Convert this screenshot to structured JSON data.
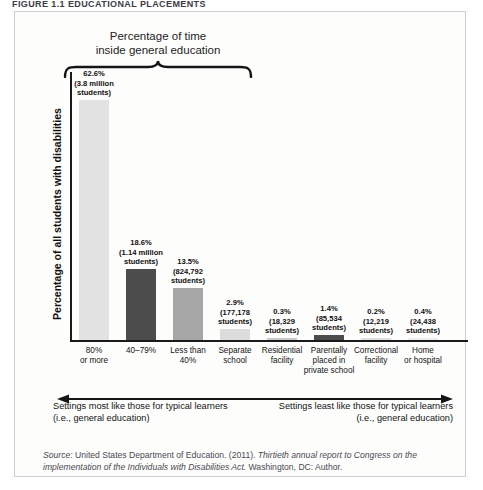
{
  "figure": {
    "heading": "FIGURE 1.1  EDUCATIONAL PLACEMENTS",
    "brace_caption_line1": "Percentage of time",
    "brace_caption_line2": "inside general education",
    "y_axis_title": "Percentage of all students with disabilities",
    "source_prefix": "Source: ",
    "source_text_1": "United States Department of Education. (2011). ",
    "source_italic_1": "Thirtieth annual report to Congress on the implementation of the Individuals with Disabilities Act.",
    "source_text_2": " Washington, DC: Author.",
    "annotation_left": "Settings most like those for typical learners (i.e., general education)",
    "annotation_right": "Settings least like those for typical learners (i.e., general education)",
    "left_arrow_icon": "left-arrow-icon",
    "right_arrow_icon": "right-arrow-icon",
    "brace_icon": "curly-brace-icon"
  },
  "chart_data": {
    "type": "bar",
    "title": "Percentage of time inside general education",
    "xlabel": "",
    "ylabel": "Percentage of all students with disabilities",
    "ylim": [
      0,
      70
    ],
    "grid": false,
    "legend": "none",
    "categories": [
      "80% or more",
      "40–79%",
      "Less than 40%",
      "Separate school",
      "Residential facility",
      "Parentally placed in private school",
      "Correctional facility",
      "Home or hospital"
    ],
    "category_lines": [
      [
        "80%",
        "or more"
      ],
      [
        "40–79%"
      ],
      [
        "Less than",
        "40%"
      ],
      [
        "Separate",
        "school"
      ],
      [
        "Residential",
        "facility"
      ],
      [
        "Parentally",
        "placed in",
        "private school"
      ],
      [
        "Correctional",
        "facility"
      ],
      [
        "Home",
        "or hospital"
      ]
    ],
    "values": [
      62.6,
      18.6,
      13.5,
      2.9,
      0.3,
      1.4,
      0.2,
      0.4
    ],
    "value_labels": [
      "62.6%",
      "18.6%",
      "13.5%",
      "2.9%",
      "0.3%",
      "1.4%",
      "0.2%",
      "0.4%"
    ],
    "counts": [
      [
        "(3.8 million",
        "students)"
      ],
      [
        "(1.14 million",
        "students)"
      ],
      [
        "(824,792",
        "students)"
      ],
      [
        "(177,178",
        "students)"
      ],
      [
        "(18,329",
        "students)"
      ],
      [
        "(85,534",
        "students)"
      ],
      [
        "(12,219",
        "students)"
      ],
      [
        "(24,438",
        "students)"
      ]
    ],
    "bar_colors": [
      "#e2e2e2",
      "#4c4c4c",
      "#a6a6a6",
      "#dcdcdc",
      "#c9c9c9",
      "#4c4c4c",
      "#dedede",
      "#ececec"
    ],
    "axis_color": "#1a1a1a"
  }
}
